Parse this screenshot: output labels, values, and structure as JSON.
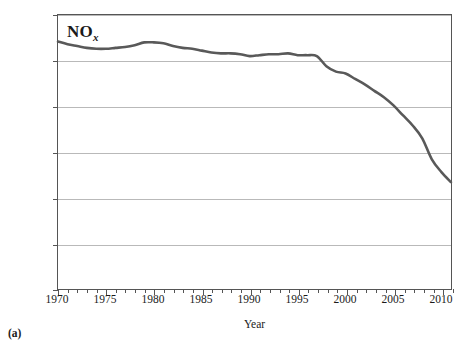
{
  "figure": {
    "caption": "(a)"
  },
  "chart_data": {
    "type": "line",
    "title": "",
    "annotation": {
      "base": "NO",
      "subscript": "x"
    },
    "xlabel": "Year",
    "ylabel": "Emissions (million short tons)",
    "xlim": [
      1970,
      2011
    ],
    "ylim": [
      0,
      30
    ],
    "grid": true,
    "legend_position": "none",
    "line_color": "#595959",
    "x_ticks_major": [
      1970,
      1975,
      1980,
      1985,
      1990,
      1995,
      2000,
      2005,
      2010
    ],
    "x_tick_labels": [
      "1970",
      "1975",
      "1980",
      "1985",
      "1990",
      "1995",
      "2000",
      "2005",
      "2010"
    ],
    "x_tick_minor_step": 1,
    "y_ticks": [
      0,
      5,
      10,
      15,
      20,
      25,
      30
    ],
    "y_tick_labels": [
      "0",
      "5",
      "10",
      "15",
      "20",
      "25",
      "30"
    ],
    "series": [
      {
        "name": "NOx",
        "x": [
          1970,
          1971,
          1972,
          1973,
          1974,
          1975,
          1976,
          1977,
          1978,
          1979,
          1980,
          1981,
          1982,
          1983,
          1984,
          1985,
          1986,
          1987,
          1988,
          1989,
          1990,
          1991,
          1992,
          1993,
          1994,
          1995,
          1996,
          1997,
          1998,
          1999,
          2000,
          2001,
          2002,
          2003,
          2004,
          2005,
          2006,
          2007,
          2008,
          2009,
          2010,
          2011
        ],
        "values": [
          27.1,
          26.8,
          26.6,
          26.4,
          26.3,
          26.3,
          26.4,
          26.5,
          26.7,
          27.0,
          27.0,
          26.9,
          26.6,
          26.4,
          26.3,
          26.1,
          25.9,
          25.8,
          25.8,
          25.7,
          25.5,
          25.6,
          25.7,
          25.7,
          25.8,
          25.6,
          25.6,
          25.5,
          24.4,
          23.8,
          23.6,
          23.0,
          22.4,
          21.7,
          21.0,
          20.1,
          19.0,
          17.9,
          16.5,
          14.2,
          12.8,
          11.7
        ]
      }
    ]
  }
}
